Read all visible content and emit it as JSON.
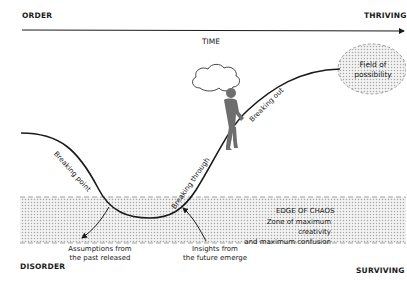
{
  "diagram": {
    "corners": {
      "top_left": "ORDER",
      "top_right": "THRIVING",
      "bottom_left": "DISORDER",
      "bottom_right": "SURVIVING"
    },
    "axis": {
      "label": "TIME"
    },
    "curve_labels": {
      "breaking_point": "Breaking point",
      "breaking_through": "Breaking through",
      "breaking_out": "Breaking out"
    },
    "field_of_possibility": {
      "line1": "Field of",
      "line2": "possibility"
    },
    "chaos_zone": {
      "title": "EDGE OF CHAOS",
      "line1": "Zone of maximum creativity",
      "line2": "and maximum confusion"
    },
    "annotations": {
      "assumptions": {
        "line1": "Assumptions from",
        "line2": "the past released"
      },
      "insights": {
        "line1": "Insights from",
        "line2": "the future emerge"
      }
    },
    "colors": {
      "line": "#1a1a1a",
      "figure": "#6e6e6e",
      "dots": "#b5b5b5"
    }
  }
}
